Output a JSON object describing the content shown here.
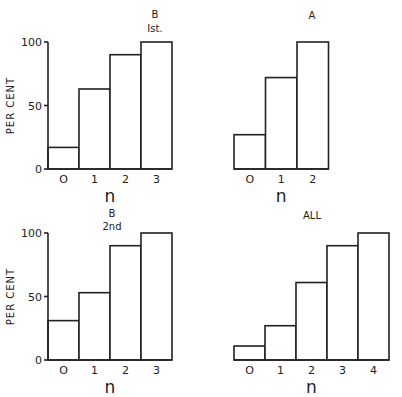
{
  "chart_data": [
    {
      "type": "bar",
      "panel": "top-left",
      "title": "B",
      "subtitle": "Ist.",
      "xlabel": "n",
      "ylabel": "PER CENT",
      "categories": [
        "O",
        "1",
        "2",
        "3"
      ],
      "values": [
        17,
        63,
        90,
        100
      ],
      "ylim": [
        0,
        100
      ],
      "yticks": [
        "0",
        "50",
        "100"
      ],
      "grid": false
    },
    {
      "type": "bar",
      "panel": "top-right",
      "title": "A",
      "subtitle": "",
      "xlabel": "n",
      "ylabel": "",
      "categories": [
        "O",
        "1",
        "2"
      ],
      "values": [
        27,
        72,
        100
      ],
      "ylim": [
        0,
        100
      ],
      "yticks": [],
      "grid": false
    },
    {
      "type": "bar",
      "panel": "bottom-left",
      "title": "B",
      "subtitle": "2nd",
      "xlabel": "n",
      "ylabel": "PER CENT",
      "categories": [
        "O",
        "1",
        "2",
        "3"
      ],
      "values": [
        31,
        53,
        90,
        100
      ],
      "ylim": [
        0,
        100
      ],
      "yticks": [
        "0",
        "50",
        "100"
      ],
      "grid": false
    },
    {
      "type": "bar",
      "panel": "bottom-right",
      "title": "ALL",
      "subtitle": "",
      "xlabel": "n",
      "ylabel": "",
      "categories": [
        "O",
        "1",
        "2",
        "3",
        "4"
      ],
      "values": [
        11,
        27,
        61,
        90,
        100
      ],
      "ylim": [
        0,
        100
      ],
      "yticks": [],
      "grid": false
    }
  ],
  "layout": {
    "panels": [
      {
        "x0": 48,
        "baseline": 169,
        "top": 42,
        "barw": 31,
        "axis": true,
        "titleX": 155,
        "titleY": 18,
        "subY": 32
      },
      {
        "x0": 234,
        "baseline": 169,
        "top": 42,
        "barw": 31.5,
        "axis": false,
        "titleX": 312,
        "titleY": 19,
        "subY": 0
      },
      {
        "x0": 48,
        "baseline": 360,
        "top": 233,
        "barw": 31,
        "axis": true,
        "titleX": 112,
        "titleY": 217,
        "subY": 230
      },
      {
        "x0": 234,
        "baseline": 360,
        "top": 233,
        "barw": 31,
        "axis": false,
        "titleX": 312,
        "titleY": 219,
        "subY": 0
      }
    ]
  }
}
